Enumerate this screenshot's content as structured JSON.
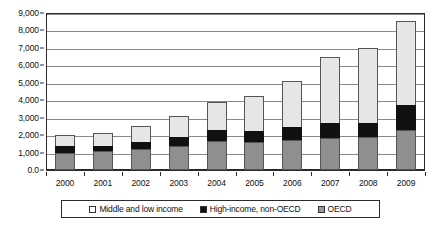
{
  "chart_data": {
    "type": "bar",
    "subtype": "stacked-vertical-bar",
    "title": "",
    "subtitle": "",
    "xlabel": "",
    "ylabel": "",
    "categories": [
      "2000",
      "2001",
      "2002",
      "2003",
      "2004",
      "2005",
      "2006",
      "2007",
      "2008",
      "2009"
    ],
    "series": [
      {
        "name": "OECD",
        "color": "#8f8f8f",
        "values": [
          1000,
          1080,
          1180,
          1400,
          1670,
          1600,
          1720,
          1830,
          1900,
          2300
        ]
      },
      {
        "name": "High-income, non-OECD",
        "color": "#111111",
        "values": [
          350,
          320,
          420,
          520,
          630,
          650,
          720,
          870,
          820,
          1400
        ]
      },
      {
        "name": "Middle and low income",
        "color": "#e6e6e6",
        "values": [
          650,
          710,
          910,
          1200,
          1580,
          1970,
          2680,
          3760,
          4260,
          4850
        ]
      }
    ],
    "totals": [
      2000,
      2110,
      2510,
      3120,
      3880,
      4220,
      5120,
      6460,
      6980,
      8550
    ],
    "ylim": [
      0,
      9000
    ],
    "ytick_values": [
      0,
      1000,
      2000,
      3000,
      4000,
      5000,
      6000,
      7000,
      8000,
      9000
    ],
    "ytick_labels": [
      "0.0",
      "1,000",
      "2,000",
      "3,000",
      "4,000",
      "5,000",
      "6,000",
      "7,000",
      "8,000",
      "9,000"
    ],
    "grid": true,
    "grid_axis": "y",
    "legend_position": "bottom",
    "legend_entries": [
      {
        "label": "Middle and low income",
        "swatch": "white"
      },
      {
        "label": "High-income, non-OECD",
        "swatch": "black"
      },
      {
        "label": "OECD",
        "swatch": "gray"
      }
    ],
    "plot_background": "#ffffff",
    "grid_color": "#8a8a8a",
    "frame_color": "#2b2b2b"
  }
}
